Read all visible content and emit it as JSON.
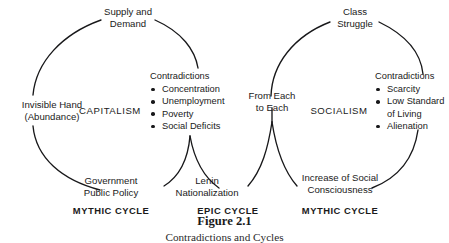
{
  "figure": {
    "caption_title": "Figure 2.1",
    "caption_subtitle": "Contradictions and Cycles",
    "ink_color": "#18181a",
    "background": "#ffffff"
  },
  "capitalism_cycle": {
    "top_label_line1": "Supply and",
    "top_label_line2": "Demand",
    "left_label_line1": "Invisible Hand",
    "left_label_line2": "(Abundance)",
    "center_label": "CAPITALISM",
    "bottom_label_line1": "Government",
    "bottom_label_line2": "Public Policy",
    "cycle_type": "MYTHIC CYCLE",
    "contradictions": {
      "heading": "Contradictions",
      "items": [
        "Concentration",
        "Unemployment",
        "Poverty",
        "Social Deficits"
      ]
    }
  },
  "epic_cycle": {
    "label_line1": "Lenin",
    "label_line2": "Nationalization",
    "cycle_type": "EPIC CYCLE"
  },
  "socialism_cycle": {
    "top_label_line1": "Class",
    "top_label_line2": "Struggle",
    "left_label_line1": "From Each",
    "left_label_line2": "to Each",
    "center_label": "SOCIALISM",
    "bottom_label_line1": "Increase of Social",
    "bottom_label_line2": "Consciousness",
    "cycle_type": "MYTHIC CYCLE",
    "contradictions": {
      "heading": "Contradictions",
      "items": [
        "Scarcity",
        "Low Standard",
        "of Living",
        "Alienation"
      ],
      "item_is_continuation": [
        false,
        false,
        true,
        false
      ]
    }
  }
}
